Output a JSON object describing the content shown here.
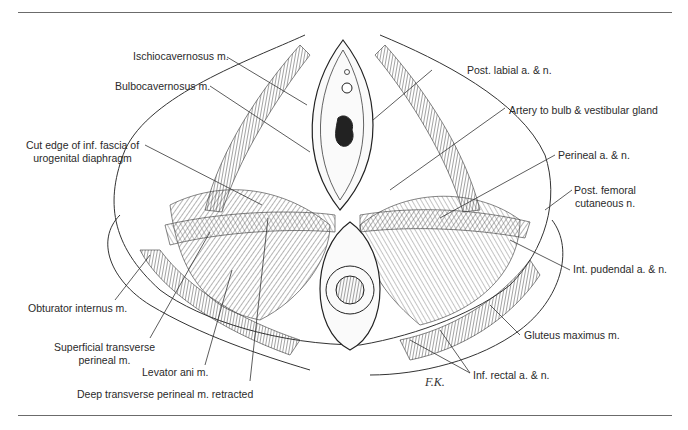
{
  "figure": {
    "type": "anatomical-illustration",
    "signature": "F.K."
  },
  "labels": {
    "ischiocavernosus": "Ischiocavernosus m.",
    "bulbocavernosus": "Bulbocavernosus m.",
    "cut_edge_line1": "Cut edge of inf. fascia of",
    "cut_edge_line2": "urogenital diaphragm",
    "obturator_internus": "Obturator internus m.",
    "superficial_transverse_line1": "Superficial transverse",
    "superficial_transverse_line2": "perineal m.",
    "levator_ani": "Levator ani m.",
    "deep_transverse": "Deep transverse perineal m. retracted",
    "post_labial": "Post. labial a. & n.",
    "artery_bulb": "Artery to bulb & vestibular gland",
    "perineal": "Perineal a. & n.",
    "post_femoral_line1": "Post. femoral",
    "post_femoral_line2": "cutaneous n.",
    "int_pudendal": "Int. pudendal a. & n.",
    "gluteus_maximus": "Gluteus maximus m.",
    "inf_rectal": "Inf. rectal a. & n."
  },
  "colors": {
    "ink": "#2a2a2a",
    "rule": "#6b6b6b",
    "background": "#ffffff"
  }
}
